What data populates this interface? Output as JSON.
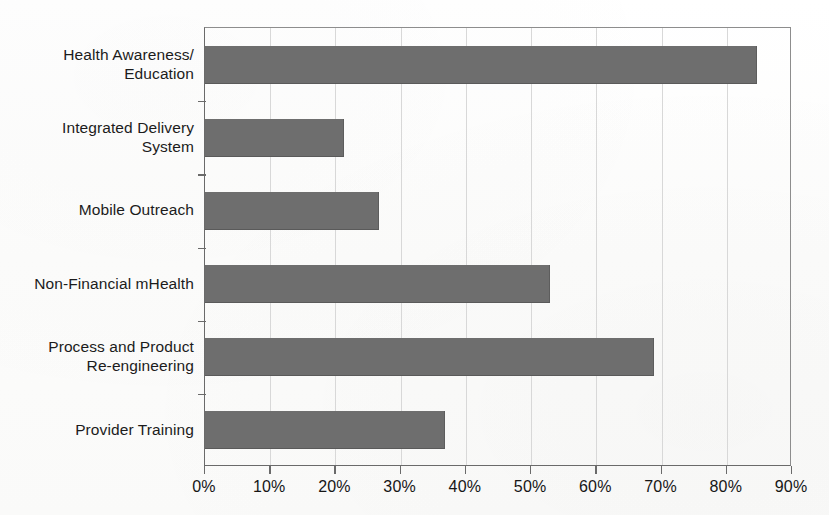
{
  "chart_data": {
    "type": "bar",
    "orientation": "horizontal",
    "title": "",
    "xlabel": "",
    "ylabel": "",
    "categories": [
      "Health Awareness/\nEducation",
      "Integrated Delivery\nSystem",
      "Mobile Outreach",
      "Non-Financial mHealth",
      "Process and Product\nRe-engineering",
      "Provider Training"
    ],
    "values": [
      84.6,
      21.3,
      26.7,
      52.9,
      68.8,
      36.8
    ],
    "value_unit": "%",
    "xlim": [
      0,
      90
    ],
    "xtick_values": [
      0,
      10,
      20,
      30,
      40,
      50,
      60,
      70,
      80,
      90
    ],
    "xtick_labels": [
      "0%",
      "10%",
      "20%",
      "30%",
      "40%",
      "50%",
      "60%",
      "70%",
      "80%",
      "90%"
    ],
    "grid": "vertical",
    "legend": "none",
    "bar_color": "#6e6e6e",
    "gridline_color": "#d8d8d8",
    "axis_color": "#6a6a6a",
    "background_color": "#fdfdfc"
  },
  "caption": {
    "fragment": ""
  }
}
